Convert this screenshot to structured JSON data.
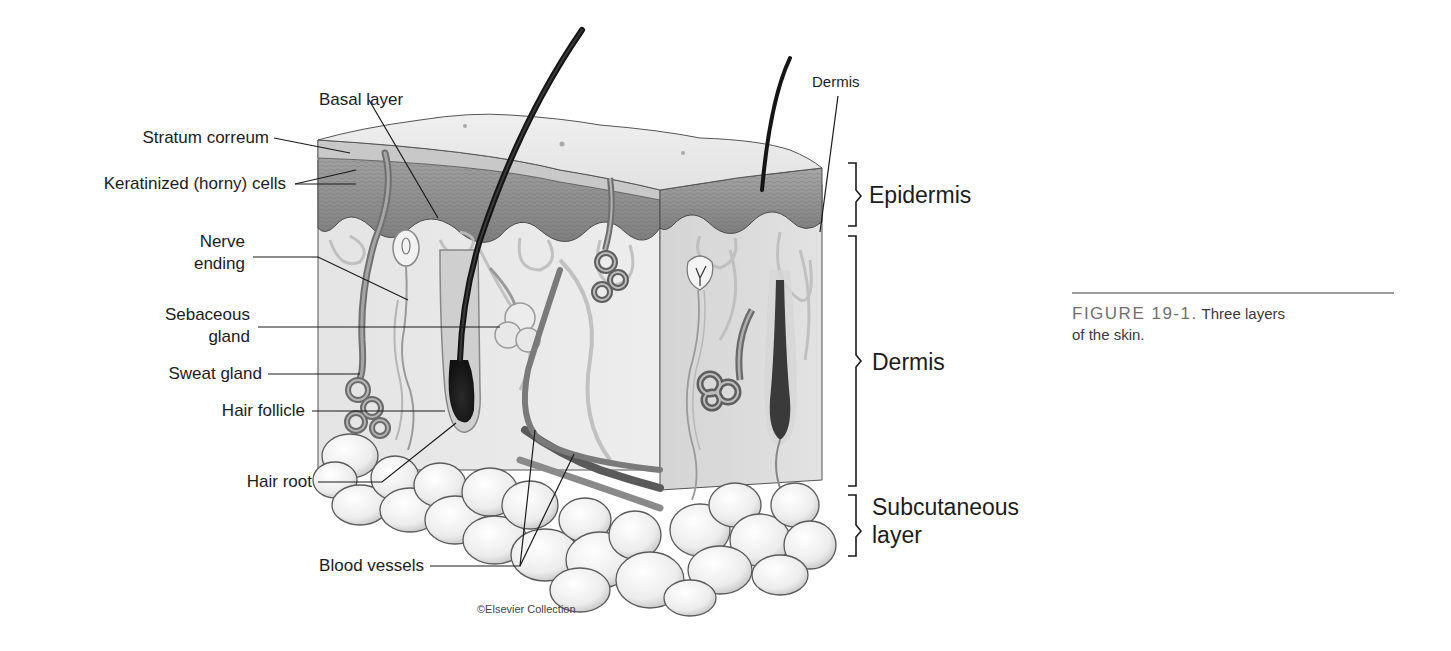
{
  "figure": {
    "title": "Three layers of the skin",
    "credit": "©Elsevier Collection"
  },
  "labels": {
    "basal_layer": "Basal layer",
    "stratum_correum": "Stratum correum",
    "keratinized_cells": "Keratinized (horny) cells",
    "nerve_ending_1": "Nerve",
    "nerve_ending_2": "ending",
    "sebaceous_gland_1": "Sebaceous",
    "sebaceous_gland_2": "gland",
    "sweat_gland": "Sweat gland",
    "hair_follicle": "Hair follicle",
    "hair_root": "Hair root",
    "blood_vessels": "Blood vessels",
    "dermis_top": "Dermis"
  },
  "layers": {
    "epidermis": "Epidermis",
    "dermis": "Dermis",
    "subcutaneous_1": "Subcutaneous",
    "subcutaneous_2": "layer"
  },
  "caption": {
    "number": "FIGURE 19-1.",
    "text_line1": "Three layers",
    "text_line2": "of the skin."
  },
  "colors": {
    "leader_line": "#1a1a1a",
    "epidermis_fill": "#8c8c8c",
    "dermis_fill": "#e6e6e6",
    "fat_fill": "#f2f2f2",
    "caption_rule": "#9a9a9a",
    "caption_number": "#707070"
  }
}
